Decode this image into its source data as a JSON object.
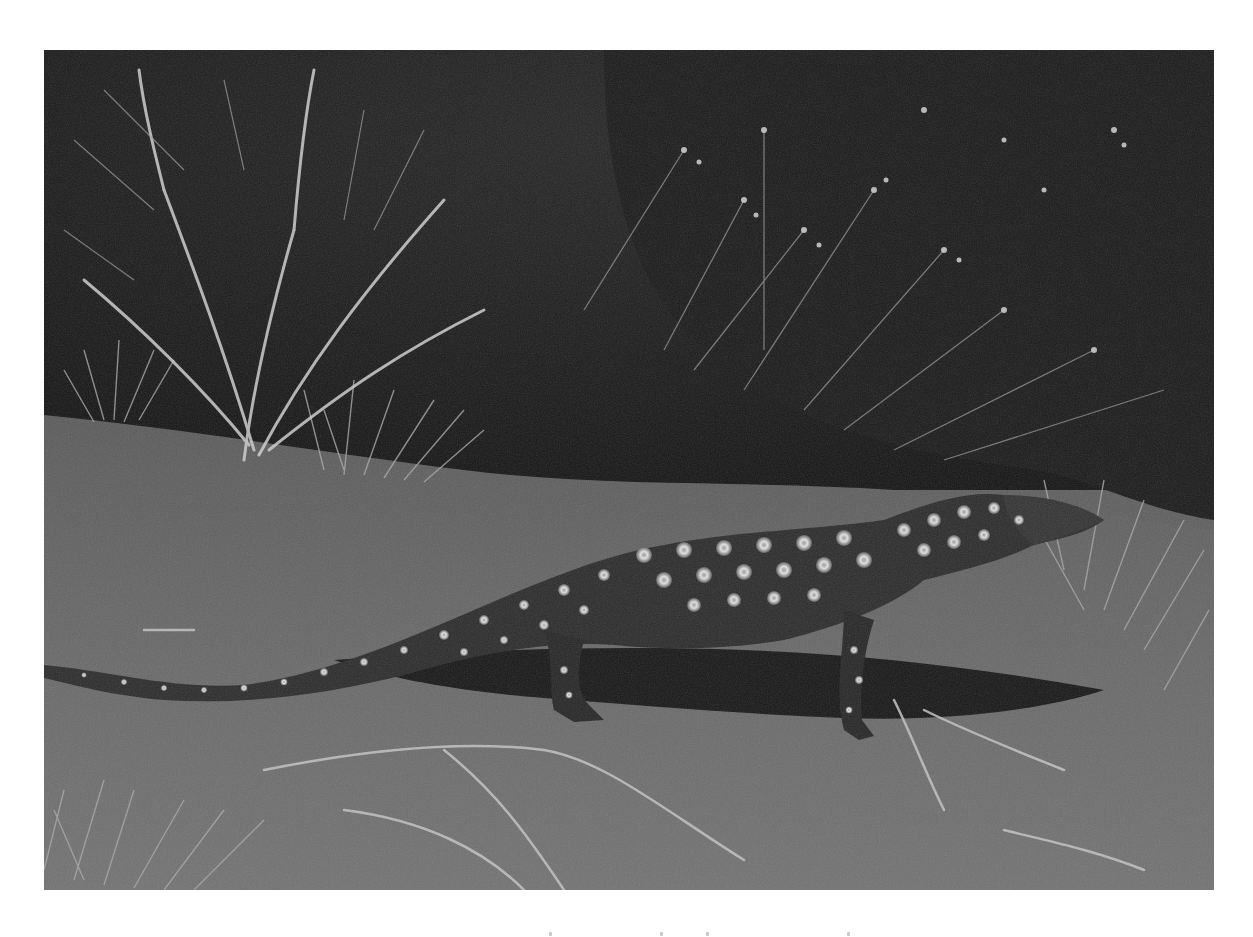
{
  "image": {
    "kind": "photograph",
    "color_mode": "grayscale",
    "subject": "spotted monitor lizard (goanna) walking on sand",
    "elements": [
      "lizard",
      "lizard-shadow",
      "sand-ground",
      "dry-shrubs",
      "grass-tufts",
      "dead-branches",
      "dark-vegetation-background"
    ],
    "frame": {
      "left": 44,
      "top": 50,
      "width": 1170,
      "height": 840,
      "border_color": "#ffffff"
    },
    "palette": {
      "sand": "#6b6b6b",
      "background_foliage": "#1e1e1e",
      "lizard_body": "#2a2a2a",
      "lizard_spots": "#d8d8d8",
      "shadow": "#161616",
      "grass_highlight": "#bdbdbd"
    }
  },
  "caption_fragment": {
    "visible": true,
    "legible": false,
    "mark_positions_x": [
      549,
      660,
      706,
      847
    ]
  }
}
